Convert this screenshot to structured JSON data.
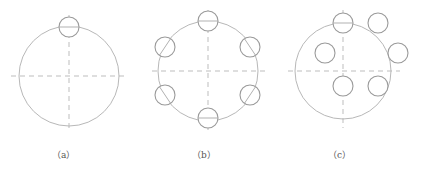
{
  "figure": {
    "panels": [
      {
        "id": "a",
        "label": "（a）",
        "caption": "one small circle tangent to top of big circle",
        "big_circle": {
          "cx": 69,
          "cy": 76,
          "r": 50
        },
        "small_circles": [
          {
            "cx": 69,
            "cy": 27,
            "r": 10
          }
        ]
      },
      {
        "id": "b",
        "label": "（b）",
        "caption": "six small circles equally spaced on big circle",
        "big_circle": {
          "cx": 208,
          "cy": 71,
          "r": 50
        },
        "small_circles": [
          {
            "cx": 208,
            "cy": 21,
            "r": 10
          },
          {
            "cx": 250,
            "cy": 47,
            "r": 10
          },
          {
            "cx": 250,
            "cy": 95,
            "r": 10
          },
          {
            "cx": 208,
            "cy": 118,
            "r": 10
          },
          {
            "cx": 165,
            "cy": 95,
            "r": 10
          },
          {
            "cx": 165,
            "cy": 47,
            "r": 10
          }
        ]
      },
      {
        "id": "c",
        "label": "（c）",
        "caption": "six small circles in rectangular array",
        "big_circle": {
          "cx": 343,
          "cy": 71,
          "r": 48
        },
        "small_circles": [
          {
            "cx": 343,
            "cy": 23,
            "r": 10
          },
          {
            "cx": 378,
            "cy": 23,
            "r": 10
          },
          {
            "cx": 325,
            "cy": 53,
            "r": 10
          },
          {
            "cx": 398,
            "cy": 53,
            "r": 10
          },
          {
            "cx": 343,
            "cy": 86,
            "r": 10
          },
          {
            "cx": 378,
            "cy": 86,
            "r": 10
          }
        ]
      }
    ],
    "colors": {
      "big_circle": "#b8b8b8",
      "small_circle": "#9a9a9a",
      "centerline": "#b5b5b5",
      "label": "#555555",
      "background": "#ffffff"
    }
  }
}
